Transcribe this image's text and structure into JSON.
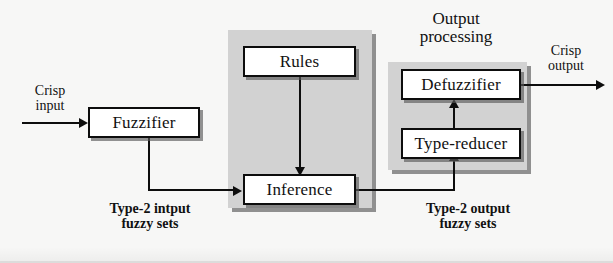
{
  "diagram": {
    "colors": {
      "background": "#f7f7f6",
      "panel_fill": "#d2d2d2",
      "panel_shadow": "#6e6e6e",
      "box_fill": "#ffffff",
      "stroke": "#0d0d0d"
    },
    "panels": [
      {
        "name": "rules-inference-panel",
        "label": ""
      },
      {
        "name": "output-processing-panel",
        "label": "Output\nprocessing"
      }
    ],
    "boxes": {
      "fuzzifier": "Fuzzifier",
      "rules": "Rules",
      "inference": "Inference",
      "defuzzifier": "Defuzzifier",
      "type_reducer": "Type-reducer"
    },
    "labels": {
      "crisp_input_line1": "Crisp",
      "crisp_input_line2": "input",
      "crisp_output_line1": "Crisp",
      "crisp_output_line2": "output",
      "output_processing_line1": "Output",
      "output_processing_line2": "processing",
      "type2_input_line1": "Type-2 intput",
      "type2_input_line2": "fuzzy sets",
      "type2_output_line1": "Type-2 output",
      "type2_output_line2": "fuzzy sets"
    },
    "connections": [
      {
        "name": "input-to-fuzzifier",
        "from": "crisp input",
        "to": "Fuzzifier"
      },
      {
        "name": "fuzzifier-to-inference",
        "from": "Fuzzifier",
        "to": "Inference"
      },
      {
        "name": "rules-to-inference",
        "from": "Rules",
        "to": "Inference"
      },
      {
        "name": "inference-to-type-reducer",
        "from": "Inference",
        "to": "Type-reducer"
      },
      {
        "name": "type-reducer-to-defuzzifier",
        "from": "Type-reducer",
        "to": "Defuzzifier"
      },
      {
        "name": "defuzzifier-to-output",
        "from": "Defuzzifier",
        "to": "crisp output"
      }
    ]
  }
}
